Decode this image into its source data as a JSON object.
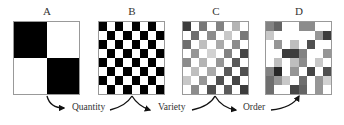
{
  "panels": [
    {
      "label": "A",
      "x": 13,
      "rows": 2,
      "cols": 2,
      "cells": [
        0,
        255,
        255,
        0
      ]
    },
    {
      "label": "B",
      "x": 98,
      "rows": 8,
      "cols": 8,
      "cells": [
        0,
        255,
        0,
        255,
        0,
        255,
        0,
        255,
        255,
        0,
        255,
        0,
        255,
        0,
        255,
        0,
        0,
        255,
        0,
        255,
        0,
        255,
        0,
        255,
        255,
        0,
        255,
        0,
        255,
        0,
        255,
        0,
        0,
        255,
        0,
        255,
        0,
        255,
        0,
        255,
        255,
        0,
        255,
        0,
        255,
        0,
        255,
        0,
        0,
        255,
        0,
        255,
        0,
        255,
        0,
        255,
        255,
        0,
        255,
        0,
        255,
        0,
        255,
        0
      ]
    },
    {
      "label": "C",
      "x": 182,
      "rows": 8,
      "cols": 8,
      "cells": [
        60,
        255,
        120,
        255,
        130,
        255,
        180,
        255,
        255,
        110,
        255,
        140,
        255,
        200,
        255,
        120,
        110,
        255,
        190,
        255,
        170,
        255,
        140,
        255,
        255,
        150,
        255,
        210,
        255,
        130,
        255,
        70,
        140,
        255,
        180,
        255,
        150,
        255,
        90,
        255,
        255,
        190,
        255,
        170,
        255,
        90,
        255,
        80,
        200,
        255,
        150,
        255,
        80,
        255,
        70,
        255,
        255,
        140,
        255,
        80,
        255,
        90,
        255,
        60
      ]
    },
    {
      "label": "D",
      "x": 265,
      "rows": 8,
      "cols": 8,
      "cells": [
        130,
        100,
        255,
        255,
        140,
        140,
        255,
        255,
        200,
        255,
        255,
        255,
        255,
        255,
        150,
        60,
        255,
        150,
        255,
        190,
        255,
        80,
        255,
        255,
        255,
        255,
        60,
        60,
        130,
        255,
        255,
        150,
        255,
        190,
        255,
        190,
        140,
        255,
        200,
        255,
        130,
        40,
        255,
        150,
        255,
        70,
        255,
        80,
        110,
        150,
        200,
        255,
        110,
        255,
        150,
        210,
        110,
        255,
        255,
        70,
        100,
        255,
        150,
        255
      ]
    }
  ],
  "captions": [
    {
      "text": "Quantity",
      "x": 72
    },
    {
      "text": "Variety",
      "x": 158
    },
    {
      "text": "Order",
      "x": 243
    }
  ],
  "colors": {
    "border": "#999999",
    "text": "#333333",
    "arrow": "#111111"
  }
}
